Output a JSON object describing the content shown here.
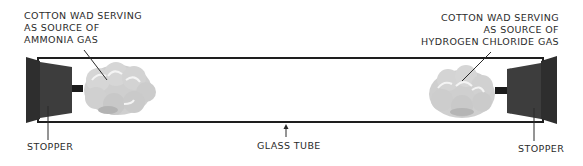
{
  "diagram": {
    "labels": {
      "left_cotton": [
        "COTTON WAD SERVING",
        "AS SOURCE OF",
        "AMMONIA GAS"
      ],
      "right_cotton": [
        "COTTON WAD SERVING",
        "AS SOURCE OF",
        "HYDROGEN CHLORIDE GAS"
      ],
      "left_stopper": "STOPPER",
      "right_stopper": "STOPPER",
      "tube": "GLASS TUBE"
    },
    "colors": {
      "stopper": "#3a3a3a",
      "tube_outline": "#1e1e1e",
      "cotton_fill": "#cfcfcf",
      "cotton_highlight": "#f2f2f2",
      "rod": "#1a1a1a"
    }
  }
}
